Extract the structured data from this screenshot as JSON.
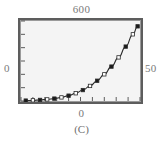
{
  "panel": {
    "caption": "(C)",
    "frame_color": "#5d5d5d",
    "plot_background": "#f4f4f4",
    "curve_color": "#2b2b2b",
    "marker_fill_color": "#1a1a1a",
    "marker_open_color": "#ffffff"
  },
  "labels": {
    "top": "600",
    "left": "0",
    "right": "50",
    "bottom": "0"
  },
  "chart_data": {
    "type": "line",
    "title": "(C)",
    "xlabel": "",
    "ylabel": "",
    "xlim": [
      0,
      50
    ],
    "ylim": [
      0,
      600
    ],
    "grid": false,
    "legend": "none",
    "axis_tick_labels": {
      "y_top": "600",
      "y_bottom": "0",
      "x_left": "0",
      "x_right": "50"
    },
    "x_ticks": [
      0,
      5,
      10,
      15,
      20,
      25,
      30,
      35,
      40,
      45,
      50
    ],
    "y_ticks": [
      0,
      100,
      200,
      300,
      400,
      500,
      600
    ],
    "marker_style": "alternating filled and open squares",
    "series": [
      {
        "name": "curve",
        "x": [
          2,
          5,
          8,
          11,
          14,
          17,
          20,
          23,
          26,
          29,
          32,
          35,
          38,
          41,
          44,
          47,
          49
        ],
        "values": [
          3,
          5,
          8,
          12,
          18,
          27,
          40,
          58,
          82,
          113,
          152,
          200,
          258,
          327,
          408,
          500,
          560
        ],
        "marker_filled": [
          true,
          false,
          true,
          false,
          true,
          false,
          true,
          false,
          true,
          false,
          true,
          false,
          true,
          false,
          true,
          false,
          true
        ]
      }
    ]
  }
}
